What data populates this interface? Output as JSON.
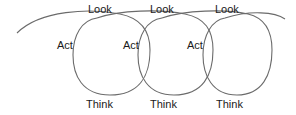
{
  "diagram": {
    "title": "",
    "type": "spiral-cycle",
    "stroke_color": "#6b6b6b",
    "text_color": "#1a1a1a",
    "cycles": [
      {
        "look": "Look",
        "act": "Act",
        "think": "Think"
      },
      {
        "look": "Look",
        "act": "Act",
        "think": "Think"
      },
      {
        "look": "Look",
        "act": "Act",
        "think": "Think"
      }
    ]
  }
}
